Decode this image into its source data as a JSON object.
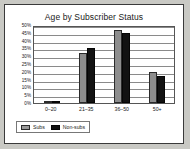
{
  "frame": {
    "background_color": "#ffffff",
    "border_color": "#3a3a3a",
    "page_background": "#c9c9c4"
  },
  "chart_data": {
    "type": "bar",
    "title": "Age by Subscriber Status",
    "xlabel": "",
    "ylabel": "",
    "categories": [
      "0–20",
      "21–35",
      "36–50",
      "50+"
    ],
    "series": [
      {
        "name": "Subs",
        "color": "#8d8d8d",
        "values": [
          0.5,
          32,
          47,
          20
        ]
      },
      {
        "name": "Non-subs",
        "color": "#121212",
        "values": [
          1,
          35,
          45,
          17
        ]
      }
    ],
    "ylim": [
      0,
      50
    ],
    "yticks": [
      "0%",
      "5%",
      "10%",
      "15%",
      "20%",
      "25%",
      "30%",
      "35%",
      "40%",
      "45%",
      "50%"
    ],
    "ytick_values": [
      0,
      5,
      10,
      15,
      20,
      25,
      30,
      35,
      40,
      45,
      50
    ],
    "grid": true,
    "legend_position": "bottom-left"
  }
}
